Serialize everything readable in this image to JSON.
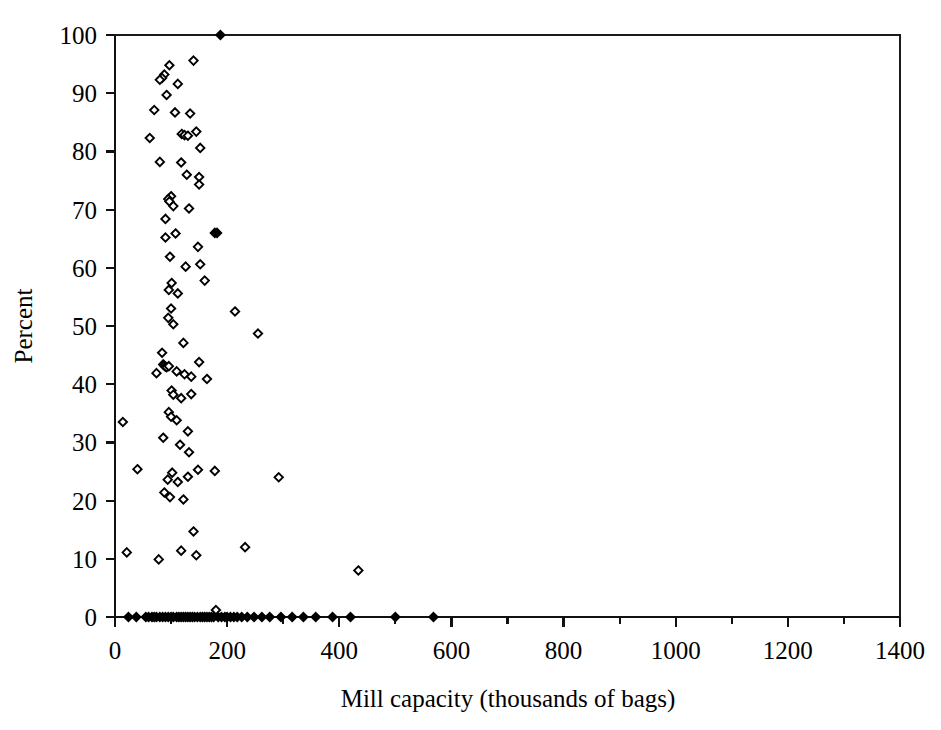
{
  "chart_data": {
    "type": "scatter",
    "title": "",
    "xlabel": "Mill capacity (thousands of bags)",
    "ylabel": "Percent",
    "xlim": [
      0,
      1400
    ],
    "ylim": [
      0,
      100
    ],
    "xticks": [
      0,
      200,
      400,
      600,
      800,
      1000,
      1200,
      1400
    ],
    "xticklabels": [
      "0",
      "200",
      "400",
      "600",
      "800",
      "1000",
      "1200",
      "1400"
    ],
    "yticks": [
      0,
      10,
      20,
      30,
      40,
      50,
      60,
      70,
      80,
      90,
      100
    ],
    "yticklabels": [
      "0",
      "10",
      "20",
      "30",
      "40",
      "50",
      "60",
      "70",
      "80",
      "90",
      "100"
    ],
    "xminor_ticks": [
      100,
      300,
      500,
      700,
      900,
      1100,
      1300
    ],
    "grid": false,
    "legend": null,
    "marker": "open-diamond",
    "marker_color": "#000000",
    "series": [
      {
        "name": "mills",
        "points": [
          [
            188,
            100.0
          ],
          [
            140,
            95.6
          ],
          [
            97,
            94.8
          ],
          [
            88,
            93.2
          ],
          [
            84,
            92.6
          ],
          [
            80,
            92.3
          ],
          [
            112,
            91.6
          ],
          [
            92,
            89.7
          ],
          [
            70,
            87.1
          ],
          [
            107,
            86.7
          ],
          [
            134,
            86.5
          ],
          [
            62,
            82.3
          ],
          [
            119,
            83.0
          ],
          [
            124,
            82.8
          ],
          [
            130,
            82.7
          ],
          [
            145,
            83.4
          ],
          [
            152,
            80.6
          ],
          [
            80,
            78.2
          ],
          [
            118,
            78.1
          ],
          [
            128,
            76.0
          ],
          [
            150,
            75.6
          ],
          [
            150,
            74.3
          ],
          [
            100,
            72.3
          ],
          [
            95,
            71.8
          ],
          [
            97,
            71.4
          ],
          [
            104,
            70.6
          ],
          [
            132,
            70.2
          ],
          [
            90,
            68.4
          ],
          [
            178,
            66.0
          ],
          [
            182,
            66.0
          ],
          [
            108,
            65.9
          ],
          [
            90,
            65.2
          ],
          [
            148,
            63.6
          ],
          [
            98,
            61.9
          ],
          [
            152,
            60.6
          ],
          [
            126,
            60.2
          ],
          [
            160,
            57.8
          ],
          [
            101,
            57.4
          ],
          [
            96,
            56.2
          ],
          [
            112,
            55.6
          ],
          [
            100,
            53.0
          ],
          [
            214,
            52.5
          ],
          [
            95,
            51.4
          ],
          [
            104,
            50.3
          ],
          [
            255,
            48.7
          ],
          [
            122,
            47.1
          ],
          [
            84,
            45.4
          ],
          [
            86,
            43.4
          ],
          [
            88,
            43.2
          ],
          [
            90,
            43.0
          ],
          [
            92,
            42.9
          ],
          [
            96,
            43.1
          ],
          [
            74,
            41.9
          ],
          [
            110,
            42.2
          ],
          [
            124,
            41.7
          ],
          [
            136,
            41.3
          ],
          [
            150,
            43.8
          ],
          [
            164,
            40.9
          ],
          [
            101,
            38.9
          ],
          [
            104,
            38.2
          ],
          [
            118,
            37.6
          ],
          [
            136,
            38.3
          ],
          [
            14,
            33.5
          ],
          [
            96,
            35.2
          ],
          [
            100,
            34.4
          ],
          [
            110,
            33.8
          ],
          [
            130,
            31.9
          ],
          [
            86,
            30.8
          ],
          [
            116,
            29.6
          ],
          [
            132,
            28.3
          ],
          [
            40,
            25.4
          ],
          [
            102,
            24.8
          ],
          [
            148,
            25.3
          ],
          [
            178,
            25.1
          ],
          [
            94,
            23.6
          ],
          [
            112,
            23.2
          ],
          [
            130,
            24.1
          ],
          [
            292,
            24.0
          ],
          [
            88,
            21.4
          ],
          [
            98,
            20.6
          ],
          [
            122,
            20.2
          ],
          [
            140,
            14.7
          ],
          [
            21,
            11.1
          ],
          [
            78,
            9.9
          ],
          [
            118,
            11.4
          ],
          [
            145,
            10.6
          ],
          [
            232,
            12.0
          ],
          [
            434,
            8.0
          ],
          [
            24,
            0
          ],
          [
            38,
            0
          ],
          [
            55,
            0
          ],
          [
            60,
            0
          ],
          [
            66,
            0
          ],
          [
            70,
            0
          ],
          [
            74,
            0
          ],
          [
            80,
            0
          ],
          [
            85,
            0
          ],
          [
            90,
            0
          ],
          [
            95,
            0
          ],
          [
            100,
            0
          ],
          [
            104,
            0
          ],
          [
            110,
            0
          ],
          [
            114,
            0
          ],
          [
            118,
            0
          ],
          [
            122,
            0
          ],
          [
            126,
            0
          ],
          [
            130,
            0
          ],
          [
            134,
            0
          ],
          [
            138,
            0
          ],
          [
            142,
            0
          ],
          [
            147,
            0
          ],
          [
            152,
            0
          ],
          [
            156,
            0
          ],
          [
            160,
            0
          ],
          [
            164,
            0
          ],
          [
            168,
            0
          ],
          [
            172,
            0
          ],
          [
            176,
            0
          ],
          [
            180,
            1.2
          ],
          [
            184,
            0
          ],
          [
            190,
            0
          ],
          [
            196,
            0
          ],
          [
            200,
            0
          ],
          [
            206,
            0
          ],
          [
            212,
            0
          ],
          [
            218,
            0
          ],
          [
            226,
            0
          ],
          [
            236,
            0
          ],
          [
            248,
            0
          ],
          [
            262,
            0
          ],
          [
            276,
            0
          ],
          [
            296,
            0
          ],
          [
            316,
            0
          ],
          [
            336,
            0
          ],
          [
            358,
            0
          ],
          [
            388,
            0
          ],
          [
            420,
            0
          ],
          [
            500,
            0
          ],
          [
            568,
            0
          ]
        ]
      }
    ],
    "filled_points": [
      [
        188,
        100.0
      ],
      [
        178,
        66.0
      ],
      [
        182,
        66.0
      ],
      [
        24,
        0
      ],
      [
        38,
        0
      ],
      [
        55,
        0
      ],
      [
        60,
        0
      ],
      [
        66,
        0
      ],
      [
        70,
        0
      ],
      [
        74,
        0
      ],
      [
        80,
        0
      ],
      [
        85,
        0
      ],
      [
        90,
        0
      ],
      [
        95,
        0
      ],
      [
        100,
        0
      ],
      [
        104,
        0
      ],
      [
        110,
        0
      ],
      [
        114,
        0
      ],
      [
        118,
        0
      ],
      [
        122,
        0
      ],
      [
        126,
        0
      ],
      [
        130,
        0
      ],
      [
        134,
        0
      ],
      [
        138,
        0
      ],
      [
        142,
        0
      ],
      [
        147,
        0
      ],
      [
        152,
        0
      ],
      [
        156,
        0
      ],
      [
        160,
        0
      ],
      [
        164,
        0
      ],
      [
        168,
        0
      ],
      [
        172,
        0
      ],
      [
        176,
        0
      ],
      [
        184,
        0
      ],
      [
        190,
        0
      ],
      [
        196,
        0
      ],
      [
        200,
        0
      ],
      [
        206,
        0
      ],
      [
        212,
        0
      ],
      [
        218,
        0
      ],
      [
        226,
        0
      ],
      [
        236,
        0
      ],
      [
        248,
        0
      ],
      [
        262,
        0
      ],
      [
        276,
        0
      ],
      [
        296,
        0
      ],
      [
        316,
        0
      ],
      [
        336,
        0
      ],
      [
        358,
        0
      ],
      [
        388,
        0
      ],
      [
        420,
        0
      ],
      [
        500,
        0
      ],
      [
        568,
        0
      ]
    ]
  }
}
